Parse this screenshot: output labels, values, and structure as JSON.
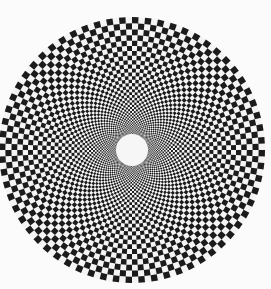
{
  "image": {
    "description": "Radial (log-polar) black and white checkerboard disk with a white circle at the center",
    "width": 271,
    "height": 289,
    "background_color": "#fbfbfb"
  },
  "pattern": {
    "type": "log-polar-checkerboard",
    "center": [
      132,
      150
    ],
    "outer_radius": 133,
    "inner_radius": 16,
    "angular_sectors": 128,
    "dark_color": "#1b1b1b",
    "light_color": "#f4f4f4",
    "center_disk_color": "#f6f6f6"
  }
}
